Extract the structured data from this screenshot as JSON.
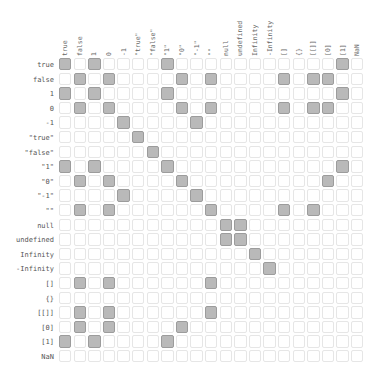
{
  "chart_data": {
    "type": "heatmap",
    "title": "",
    "xlabel": "",
    "ylabel": "",
    "labels": [
      "true",
      "false",
      "1",
      "0",
      "-1",
      "\"true\"",
      "\"false\"",
      "\"1\"",
      "\"0\"",
      "\"-1\"",
      "\"\"",
      "null",
      "undefined",
      "Infinity",
      "-Infinity",
      "[]",
      "{}",
      "[[]]",
      "[0]",
      "[1]",
      "NaN"
    ],
    "matrix": [
      [
        1,
        0,
        1,
        0,
        0,
        0,
        0,
        1,
        0,
        0,
        0,
        0,
        0,
        0,
        0,
        0,
        0,
        0,
        0,
        1,
        0
      ],
      [
        0,
        1,
        0,
        1,
        0,
        0,
        0,
        0,
        1,
        0,
        1,
        0,
        0,
        0,
        0,
        1,
        0,
        1,
        1,
        0,
        0
      ],
      [
        1,
        0,
        1,
        0,
        0,
        0,
        0,
        1,
        0,
        0,
        0,
        0,
        0,
        0,
        0,
        0,
        0,
        0,
        0,
        1,
        0
      ],
      [
        0,
        1,
        0,
        1,
        0,
        0,
        0,
        0,
        1,
        0,
        1,
        0,
        0,
        0,
        0,
        1,
        0,
        1,
        1,
        0,
        0
      ],
      [
        0,
        0,
        0,
        0,
        1,
        0,
        0,
        0,
        0,
        1,
        0,
        0,
        0,
        0,
        0,
        0,
        0,
        0,
        0,
        0,
        0
      ],
      [
        0,
        0,
        0,
        0,
        0,
        1,
        0,
        0,
        0,
        0,
        0,
        0,
        0,
        0,
        0,
        0,
        0,
        0,
        0,
        0,
        0
      ],
      [
        0,
        0,
        0,
        0,
        0,
        0,
        1,
        0,
        0,
        0,
        0,
        0,
        0,
        0,
        0,
        0,
        0,
        0,
        0,
        0,
        0
      ],
      [
        1,
        0,
        1,
        0,
        0,
        0,
        0,
        1,
        0,
        0,
        0,
        0,
        0,
        0,
        0,
        0,
        0,
        0,
        0,
        1,
        0
      ],
      [
        0,
        1,
        0,
        1,
        0,
        0,
        0,
        0,
        1,
        0,
        0,
        0,
        0,
        0,
        0,
        0,
        0,
        0,
        1,
        0,
        0
      ],
      [
        0,
        0,
        0,
        0,
        1,
        0,
        0,
        0,
        0,
        1,
        0,
        0,
        0,
        0,
        0,
        0,
        0,
        0,
        0,
        0,
        0
      ],
      [
        0,
        1,
        0,
        1,
        0,
        0,
        0,
        0,
        0,
        0,
        1,
        0,
        0,
        0,
        0,
        1,
        0,
        1,
        0,
        0,
        0
      ],
      [
        0,
        0,
        0,
        0,
        0,
        0,
        0,
        0,
        0,
        0,
        0,
        1,
        1,
        0,
        0,
        0,
        0,
        0,
        0,
        0,
        0
      ],
      [
        0,
        0,
        0,
        0,
        0,
        0,
        0,
        0,
        0,
        0,
        0,
        1,
        1,
        0,
        0,
        0,
        0,
        0,
        0,
        0,
        0
      ],
      [
        0,
        0,
        0,
        0,
        0,
        0,
        0,
        0,
        0,
        0,
        0,
        0,
        0,
        1,
        0,
        0,
        0,
        0,
        0,
        0,
        0
      ],
      [
        0,
        0,
        0,
        0,
        0,
        0,
        0,
        0,
        0,
        0,
        0,
        0,
        0,
        0,
        1,
        0,
        0,
        0,
        0,
        0,
        0
      ],
      [
        0,
        1,
        0,
        1,
        0,
        0,
        0,
        0,
        0,
        0,
        1,
        0,
        0,
        0,
        0,
        0,
        0,
        0,
        0,
        0,
        0
      ],
      [
        0,
        0,
        0,
        0,
        0,
        0,
        0,
        0,
        0,
        0,
        0,
        0,
        0,
        0,
        0,
        0,
        0,
        0,
        0,
        0,
        0
      ],
      [
        0,
        1,
        0,
        1,
        0,
        0,
        0,
        0,
        0,
        0,
        1,
        0,
        0,
        0,
        0,
        0,
        0,
        0,
        0,
        0,
        0
      ],
      [
        0,
        1,
        0,
        1,
        0,
        0,
        0,
        0,
        1,
        0,
        0,
        0,
        0,
        0,
        0,
        0,
        0,
        0,
        0,
        0,
        0
      ],
      [
        1,
        0,
        1,
        0,
        0,
        0,
        0,
        1,
        0,
        0,
        0,
        0,
        0,
        0,
        0,
        0,
        0,
        0,
        0,
        0,
        0
      ],
      [
        0,
        0,
        0,
        0,
        0,
        0,
        0,
        0,
        0,
        0,
        0,
        0,
        0,
        0,
        0,
        0,
        0,
        0,
        0,
        0,
        0
      ]
    ],
    "legend": "",
    "grid": true
  },
  "colors": {
    "on": "#b9b9b9",
    "off": "#ffffff",
    "border": "#e6e6e6"
  }
}
